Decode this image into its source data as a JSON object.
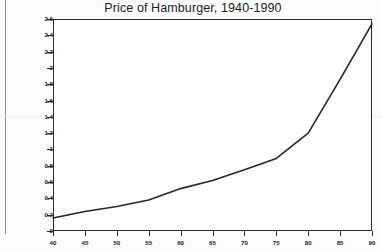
{
  "chart_data": {
    "type": "line",
    "title": "Price of Hamburger, 1940-1990",
    "xlabel": "",
    "ylabel": "",
    "x": [
      40,
      45,
      50,
      55,
      60,
      65,
      70,
      75,
      80,
      85,
      90
    ],
    "values": [
      0.16,
      0.24,
      0.3,
      0.38,
      0.52,
      0.62,
      0.75,
      0.89,
      1.2,
      1.86,
      2.54
    ],
    "series": [
      {
        "name": "Price of Hamburger",
        "values": [
          0.16,
          0.24,
          0.3,
          0.38,
          0.52,
          0.62,
          0.75,
          0.89,
          1.2,
          1.86,
          2.54
        ]
      }
    ],
    "xlim": [
      40,
      90
    ],
    "ylim": [
      0,
      2.6
    ],
    "x_ticks": [
      40,
      45,
      50,
      55,
      60,
      65,
      70,
      75,
      80,
      85,
      90
    ],
    "x_tick_labels": [
      "40",
      "45",
      "50",
      "55",
      "60",
      "65",
      "70",
      "75",
      "80",
      "85",
      "90"
    ],
    "y_ticks": [
      0,
      0.2,
      0.4,
      0.6,
      0.8,
      1,
      1.2,
      1.4,
      1.6,
      1.8,
      2,
      2.2,
      2.4,
      2.6
    ],
    "y_tick_labels": [
      "0",
      "0.2",
      "0.4",
      "0.6",
      "0.8",
      "1",
      "1.2",
      "1.4",
      "1.6",
      "1.8",
      "2",
      "2.2",
      "2.4",
      "2.6"
    ],
    "grid": false,
    "legend": false,
    "legend_position": "none",
    "line_color": "#262626",
    "plot_background": "#ffffff",
    "frame_color": "#2a2a2a",
    "annotations": []
  }
}
